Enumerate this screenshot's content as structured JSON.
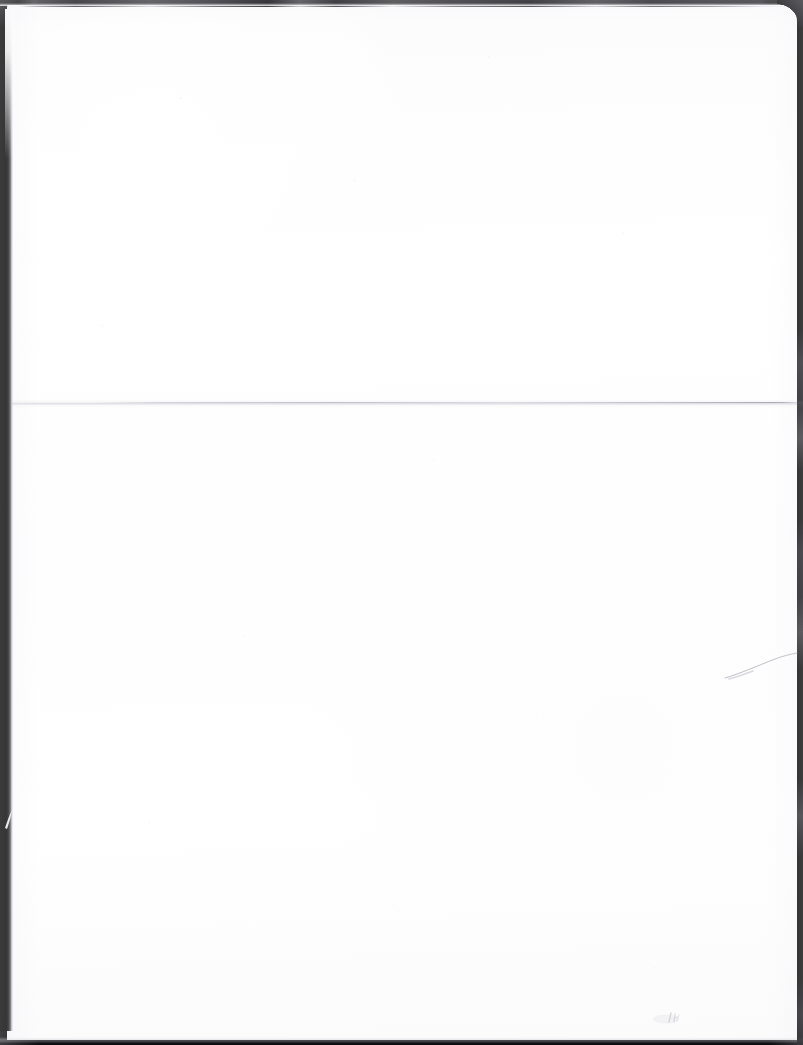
{
  "document": {
    "kind": "scanned-page",
    "surface": "blank",
    "page_label": "",
    "visible_text": "",
    "page_color": "#fefeff",
    "background_color": "#111111"
  },
  "artifacts": {
    "left_edge_band": {
      "name": "scanner-edge-shadow-left",
      "color": "#0b0b0b"
    },
    "top_edge_band": {
      "name": "scanner-edge-shadow-top",
      "color": "#2a2a30"
    },
    "bottom_edge_band": {
      "name": "scanner-edge-shadow-bottom",
      "color": "#0b0b0d"
    },
    "right_edge_band": {
      "name": "scanner-edge-shadow-right",
      "color": "#1a1a20"
    },
    "fold_crease": {
      "name": "horizontal-fold-crease",
      "color": "#b4b4c0"
    },
    "edge_scratch": {
      "name": "diagonal-scratch",
      "color": "#a9a9b4"
    },
    "pencil_smudge": {
      "name": "faint-pencil-smudge",
      "color": "#b9b9c2"
    },
    "edge_nick": {
      "name": "white-nick-in-edge-band",
      "color": "#f6f6f8"
    }
  }
}
